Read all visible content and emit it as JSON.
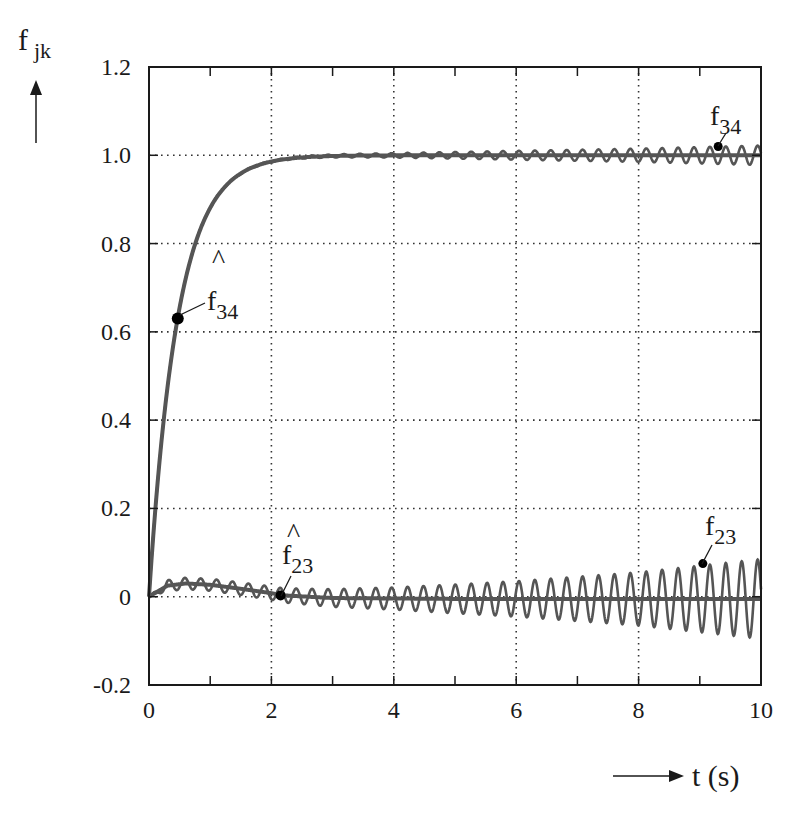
{
  "chart_data": {
    "type": "line",
    "title": "",
    "ylabel": {
      "base": "f",
      "subscript": "jk"
    },
    "xlabel": "t (s)",
    "xlim": [
      0,
      10
    ],
    "ylim": [
      -0.2,
      1.2
    ],
    "xticks": [
      0,
      2,
      4,
      6,
      8,
      10
    ],
    "xtick_labels": [
      "0",
      "2",
      "4",
      "6",
      "8",
      "10"
    ],
    "xminor_ticks": [
      1,
      3,
      5,
      7,
      9
    ],
    "yticks": [
      -0.2,
      0,
      0.2,
      0.4,
      0.6,
      0.8,
      1.0,
      1.2
    ],
    "ytick_labels": [
      "-0.2",
      "0",
      "0.2",
      "0.4",
      "0.6",
      "0.8",
      "1.0",
      "1.2"
    ],
    "grid": {
      "on": true,
      "style": "dotted",
      "x_at": [
        2,
        4,
        6,
        8
      ],
      "y_at": [
        0,
        0.2,
        0.4,
        0.6,
        0.8,
        1.0
      ]
    },
    "legend": "none (inline curve labels)",
    "series": [
      {
        "name": "f̂34",
        "label_base": "f",
        "label_sub": "34",
        "hat": true,
        "description": "estimate, first-order rise to 1.0 (time constant ≈ 0.47 s)",
        "model": {
          "kind": "exp_rise",
          "final": 1.0,
          "tau": 0.47
        },
        "x": [
          0,
          0.25,
          0.47,
          0.75,
          1.0,
          1.5,
          2.0,
          2.5,
          3.0,
          4.0,
          6.0,
          8.0,
          10.0
        ],
        "values": [
          0,
          0.41,
          0.63,
          0.8,
          0.88,
          0.96,
          0.985,
          0.995,
          1.0,
          1.0,
          1.0,
          1.0,
          1.0
        ],
        "marker": {
          "x": 0.47,
          "y": 0.63
        },
        "stroke_width": 4
      },
      {
        "name": "f34",
        "label_base": "f",
        "label_sub": "34",
        "hat": false,
        "description": "actual, follows f̂34 with a slowly growing oscillation around 1.0",
        "model": {
          "kind": "exp_rise_osc",
          "final": 1.0,
          "tau": 0.47,
          "osc_period": 0.26,
          "amp_start": 0.002,
          "amp_end": 0.022
        },
        "x": [
          2,
          4,
          6,
          8,
          10
        ],
        "oscillation_amplitude": [
          0.002,
          0.005,
          0.01,
          0.015,
          0.022
        ],
        "marker": {
          "x": 9.3,
          "y": 1.02
        },
        "stroke_width": 2
      },
      {
        "name": "f̂23",
        "label_base": "f",
        "label_sub": "23",
        "hat": true,
        "description": "estimate, small bump ~0.03 then settles near 0",
        "x": [
          0,
          0.3,
          0.6,
          1.0,
          1.5,
          2.0,
          2.2,
          3.0,
          5.0,
          10.0
        ],
        "values": [
          0,
          0.025,
          0.03,
          0.027,
          0.018,
          0.008,
          0.003,
          -0.003,
          -0.005,
          -0.005
        ],
        "marker": {
          "x": 2.15,
          "y": 0.003
        },
        "stroke_width": 4
      },
      {
        "name": "f23",
        "label_base": "f",
        "label_sub": "23",
        "hat": false,
        "description": "actual, oscillates around f̂23 with growing amplitude",
        "model": {
          "kind": "osc_growing",
          "osc_period": 0.26
        },
        "x": [
          0,
          2,
          4,
          6,
          8,
          10
        ],
        "oscillation_amplitude": [
          0.012,
          0.015,
          0.025,
          0.04,
          0.06,
          0.09
        ],
        "marker": {
          "x": 9.05,
          "y": 0.075
        },
        "stroke_width": 2
      }
    ],
    "annotations": [
      {
        "text": "f̂34",
        "x": 0.95,
        "y": 0.68
      },
      {
        "text": "f34",
        "x": 9.6,
        "y": 1.09
      },
      {
        "text": "f̂23",
        "x": 2.6,
        "y": 0.09
      },
      {
        "text": "f23",
        "x": 9.5,
        "y": 0.15
      }
    ]
  },
  "labels": {
    "y_axis_base": "f",
    "y_axis_sub": "jk",
    "x_axis": "t (s)",
    "f34_hat_base": "f",
    "f34_hat_sub": "34",
    "f34_base": "f",
    "f34_sub": "34",
    "f23_hat_base": "f",
    "f23_hat_sub": "23",
    "f23_base": "f",
    "f23_sub": "23",
    "hat_glyph": "^"
  },
  "colors": {
    "axis": "#1a1a1a",
    "grid": "#333333",
    "curve": "#555555",
    "marker": "#000000",
    "background": "#ffffff"
  }
}
